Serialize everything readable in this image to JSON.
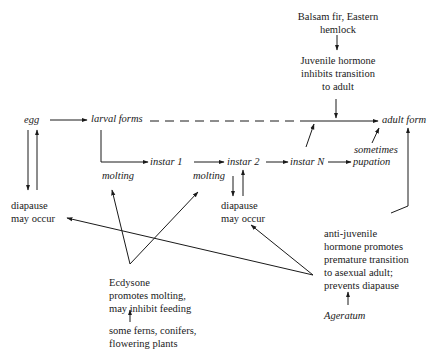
{
  "diagram": {
    "nodes": {
      "egg": "egg",
      "larval_forms": "larval forms",
      "adult_form": "adult form",
      "instar_1": "instar 1",
      "instar_2": "instar 2",
      "instar_n": "instar N",
      "pupation": "pupation",
      "sometimes": "sometimes",
      "molting_1": "molting",
      "molting_2": "molting",
      "diapause_left_1": "diapause",
      "diapause_left_2": "may occur",
      "diapause_mid_1": "diapause",
      "diapause_mid_2": "may occur"
    },
    "juvenile": {
      "source_1": "Balsam fir, Eastern",
      "source_2": "hemlock",
      "line_1": "Juvenile hormone",
      "line_2": "inhibits transition",
      "line_3": "to adult"
    },
    "ecdysone": {
      "line_1": "Ecdysone",
      "line_2": "promotes molting,",
      "line_3": "may inhibit feeding",
      "source_1": "some ferns, conifers,",
      "source_2": "flowering plants"
    },
    "anti_juvenile": {
      "line_1": "anti-juvenile",
      "line_2": "hormone promotes",
      "line_3": "premature transition",
      "line_4": "to asexual adult;",
      "line_5": "prevents diapause",
      "source": "Ageratum"
    }
  }
}
